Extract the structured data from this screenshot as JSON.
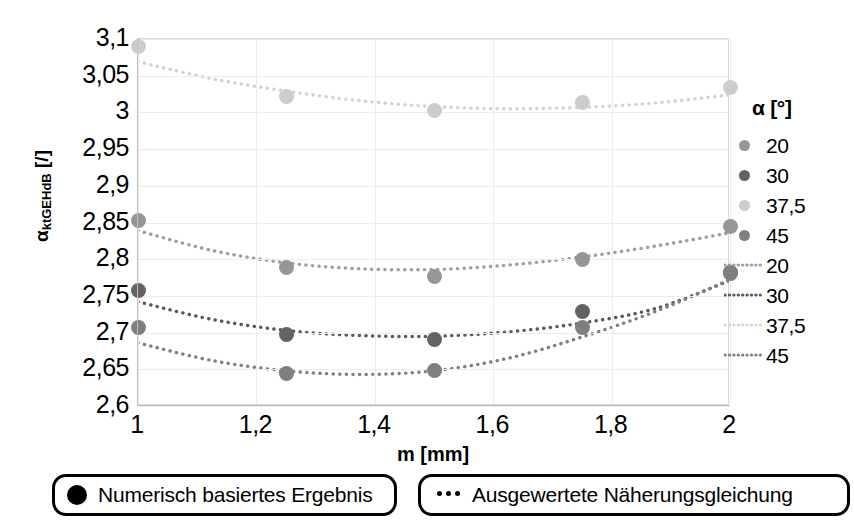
{
  "chart_data": {
    "type": "scatter",
    "title": "",
    "xlabel": "m [mm]",
    "ylabel": "αktGEHdB [/]",
    "ylabel_base": "α",
    "ylabel_sub": "ktGEHdB",
    "ylabel_unit": " [/]",
    "xlim": [
      1,
      2
    ],
    "ylim": [
      2.6,
      3.1
    ],
    "grid": true,
    "legend_position": "right",
    "legend_title": "α [°]",
    "x_ticks": [
      "1",
      "1,2",
      "1,4",
      "1,6",
      "1,8",
      "2"
    ],
    "x_tick_values": [
      1,
      1.2,
      1.4,
      1.6,
      1.8,
      2
    ],
    "y_ticks": [
      "3,1",
      "3,05",
      "3",
      "2,95",
      "2,9",
      "2,85",
      "2,8",
      "2,75",
      "2,7",
      "2,65",
      "2,6"
    ],
    "y_tick_values": [
      3.1,
      3.05,
      3.0,
      2.95,
      2.9,
      2.85,
      2.8,
      2.75,
      2.7,
      2.65,
      2.6
    ],
    "x": [
      1,
      1.25,
      1.5,
      1.75,
      2
    ],
    "series": [
      {
        "name": "20",
        "kind": "markers",
        "color": "#969696",
        "values": [
          2.853,
          2.789,
          2.776,
          2.8,
          2.845
        ]
      },
      {
        "name": "30",
        "kind": "markers",
        "color": "#636363",
        "values": [
          2.757,
          2.697,
          2.691,
          2.729,
          2.782
        ]
      },
      {
        "name": "37,5",
        "kind": "markers",
        "color": "#cccccc",
        "values": [
          3.09,
          3.021,
          3.002,
          3.013,
          3.034
        ]
      },
      {
        "name": "45",
        "kind": "markers",
        "color": "#7f7f7f",
        "values": [
          2.707,
          2.644,
          2.648,
          2.707,
          2.78
        ]
      }
    ],
    "fit_series": [
      {
        "name": "20",
        "kind": "dotted-line",
        "color": "#9e9e9e",
        "points": [
          [
            1,
            2.839
          ],
          [
            1.125,
            2.812
          ],
          [
            1.25,
            2.795
          ],
          [
            1.375,
            2.787
          ],
          [
            1.5,
            2.786
          ],
          [
            1.625,
            2.792
          ],
          [
            1.75,
            2.803
          ],
          [
            1.875,
            2.818
          ],
          [
            2,
            2.836
          ]
        ]
      },
      {
        "name": "30",
        "kind": "dotted-line",
        "color": "#5a5a5a",
        "points": [
          [
            1,
            2.742
          ],
          [
            1.125,
            2.718
          ],
          [
            1.25,
            2.703
          ],
          [
            1.375,
            2.696
          ],
          [
            1.5,
            2.695
          ],
          [
            1.625,
            2.701
          ],
          [
            1.75,
            2.713
          ],
          [
            1.875,
            2.733
          ],
          [
            2,
            2.771
          ]
        ]
      },
      {
        "name": "37,5",
        "kind": "dotted-line",
        "color": "#d2d2d2",
        "points": [
          [
            1,
            3.069
          ],
          [
            1.125,
            3.046
          ],
          [
            1.25,
            3.029
          ],
          [
            1.375,
            3.016
          ],
          [
            1.5,
            3.008
          ],
          [
            1.625,
            3.005
          ],
          [
            1.75,
            3.007
          ],
          [
            1.875,
            3.013
          ],
          [
            2,
            3.024
          ]
        ]
      },
      {
        "name": "45",
        "kind": "dotted-line",
        "color": "#808080",
        "points": [
          [
            1,
            2.686
          ],
          [
            1.125,
            2.662
          ],
          [
            1.25,
            2.648
          ],
          [
            1.375,
            2.643
          ],
          [
            1.5,
            2.648
          ],
          [
            1.625,
            2.665
          ],
          [
            1.75,
            2.694
          ],
          [
            1.875,
            2.729
          ],
          [
            2,
            2.772
          ]
        ]
      }
    ],
    "legend_marker_entries": [
      {
        "label": "20",
        "color": "#969696"
      },
      {
        "label": "30",
        "color": "#636363"
      },
      {
        "label": "37,5",
        "color": "#cccccc"
      },
      {
        "label": "45",
        "color": "#7f7f7f"
      }
    ],
    "legend_line_entries": [
      {
        "label": "20",
        "color": "#9e9e9e"
      },
      {
        "label": "30",
        "color": "#5a5a5a"
      },
      {
        "label": "37,5",
        "color": "#d8d8d8"
      },
      {
        "label": "45",
        "color": "#808080"
      }
    ]
  },
  "bottom_keys": {
    "numeric": "Numerisch basiertes Ergebnis",
    "approx": "Ausgewertete Näherungsgleichung"
  }
}
